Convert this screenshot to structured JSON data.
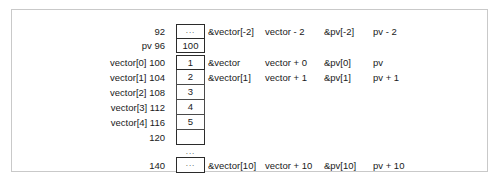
{
  "figure": {
    "columns": {
      "address": "address",
      "value": "value",
      "vector_address_expr": "&vector expression",
      "vector_pointer_expr": "vector expression",
      "pv_address_expr": "&pv expression",
      "pv_pointer_expr": "pv expression"
    },
    "rows": [
      {
        "label": "92",
        "value": "...",
        "value_is_ellipsis": true,
        "cell_style": "standalone-top",
        "expr1": "&vector[-2]",
        "expr2": "vector - 2",
        "expr3": "&pv[-2]",
        "expr4": "pv - 2"
      },
      {
        "label": "pv 96",
        "value": "100",
        "value_is_ellipsis": false,
        "cell_style": "standalone",
        "expr1": "",
        "expr2": "",
        "expr3": "",
        "expr4": ""
      },
      {
        "label": "vector[0] 100",
        "value": "1",
        "value_is_ellipsis": false,
        "cell_style": "stack-top",
        "expr1": "&vector",
        "expr2": "vector + 0",
        "expr3": "&pv[0]",
        "expr4": "pv"
      },
      {
        "label": "vector[1] 104",
        "value": "2",
        "value_is_ellipsis": false,
        "cell_style": "stack-mid",
        "expr1": "&vector[1]",
        "expr2": "vector + 1",
        "expr3": "&pv[1]",
        "expr4": "pv + 1"
      },
      {
        "label": "vector[2] 108",
        "value": "3",
        "value_is_ellipsis": false,
        "cell_style": "stack-mid",
        "expr1": "",
        "expr2": "",
        "expr3": "",
        "expr4": ""
      },
      {
        "label": "vector[3] 112",
        "value": "4",
        "value_is_ellipsis": false,
        "cell_style": "stack-mid",
        "expr1": "",
        "expr2": "",
        "expr3": "",
        "expr4": ""
      },
      {
        "label": "vector[4] 116",
        "value": "5",
        "value_is_ellipsis": false,
        "cell_style": "stack-mid",
        "expr1": "",
        "expr2": "",
        "expr3": "",
        "expr4": ""
      },
      {
        "label": "120",
        "value": "",
        "value_is_ellipsis": false,
        "cell_style": "stack-bottom",
        "expr1": "",
        "expr2": "",
        "expr3": "",
        "expr4": ""
      }
    ],
    "gap_ellipsis": "...",
    "last_row": {
      "label": "140",
      "value": "...",
      "value_is_ellipsis": true,
      "expr1": "&vector[10]",
      "expr2": "vector + 10",
      "expr3": "&pv[10]",
      "expr4": "pv + 10"
    }
  }
}
